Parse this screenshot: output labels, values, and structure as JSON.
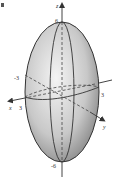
{
  "figure": {
    "type": "ellipsoid",
    "axes": {
      "x": {
        "label": "x",
        "tick_label": "3"
      },
      "y": {
        "label": "y",
        "tick_label": "3"
      },
      "z": {
        "label": "z",
        "top_label": "6",
        "bottom_label": "-6"
      },
      "neg_label": "-3"
    },
    "corner_mark": "F",
    "colors": {
      "surface_light": "#f2f2f2",
      "surface_dark": "#8a8a8a",
      "outline": "#333333",
      "axis": "#444444"
    }
  }
}
